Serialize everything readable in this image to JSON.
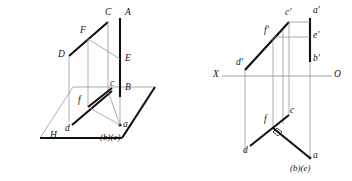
{
  "figure": {
    "colors": {
      "ink": "#111111",
      "thick_line": "#111111",
      "thin_line": "#8a8a8a",
      "background": "#ffffff"
    },
    "stroke_widths": {
      "thick": 2.1,
      "medium": 1.2,
      "thin": 0.7
    }
  },
  "pictorial_view": {
    "name": "3D pictorial projection",
    "plane_label": "H",
    "labels": {
      "A": "A",
      "B": "B",
      "C": "C",
      "D": "D",
      "E": "E",
      "F": "F",
      "a": "a",
      "c": "c",
      "d": "d",
      "f": "f",
      "be": "(b)(e)"
    }
  },
  "orthographic_view": {
    "name": "Two-view orthographic projection",
    "axis": {
      "left_label": "X",
      "right_label": "O"
    },
    "labels": {
      "a_prime": "a'",
      "b_prime": "b'",
      "c_prime": "c'",
      "d_prime": "d'",
      "e_prime": "e'",
      "f_prime": "f'",
      "a": "a",
      "c": "c",
      "d": "d",
      "f": "f",
      "be": "(b)(e)"
    },
    "right_angle_marker": "perpendicular-symbol"
  }
}
